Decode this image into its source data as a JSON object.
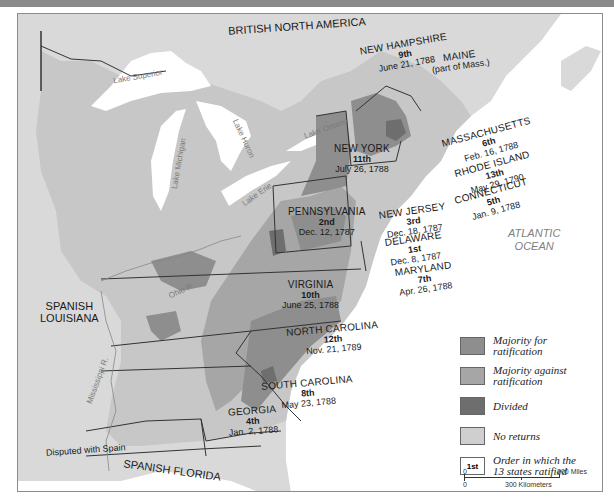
{
  "colors": {
    "majority_for": "#8e8e8e",
    "majority_against": "#a6a6a6",
    "divided": "#6e6e6e",
    "no_returns": "#cfcfcf",
    "foreign": "#d9d9d9",
    "water": "#ffffff",
    "border": "#333333"
  },
  "regions": {
    "british_north_america": "BRITISH NORTH AMERICA",
    "spanish_louisiana": "SPANISH\nLOUISIANA",
    "spanish_louisiana_l1": "SPANISH",
    "spanish_louisiana_l2": "LOUISIANA",
    "spanish_florida": "SPANISH FLORIDA",
    "disputed": "Disputed with Spain",
    "ocean_l1": "ATLANTIC",
    "ocean_l2": "OCEAN"
  },
  "water_labels": {
    "lake_superior": "Lake Superior",
    "lake_michigan": "Lake Michigan",
    "lake_huron": "Lake Huron",
    "lake_ontario": "Lake Ontario",
    "lake_erie": "Lake Erie",
    "ohio_river": "Ohio R.",
    "mississippi_river": "Mississippi R."
  },
  "states": [
    {
      "name": "NEW HAMPSHIRE",
      "order": "9th",
      "date": "June 21, 1788"
    },
    {
      "name": "MAINE",
      "order": "",
      "date": "(part of Mass.)"
    },
    {
      "name": "MASSACHUSETTS",
      "order": "6th",
      "date": "Feb. 16, 1788"
    },
    {
      "name": "NEW YORK",
      "order": "11th",
      "date": "July 26, 1788"
    },
    {
      "name": "RHODE ISLAND",
      "order": "13th",
      "date": "May 29, 1790"
    },
    {
      "name": "CONNECTICUT",
      "order": "5th",
      "date": "Jan. 9, 1788"
    },
    {
      "name": "PENNSYLVANIA",
      "order": "2nd",
      "date": "Dec. 12, 1787"
    },
    {
      "name": "NEW JERSEY",
      "order": "3rd",
      "date": "Dec. 18, 1787"
    },
    {
      "name": "DELAWARE",
      "order": "1st",
      "date": "Dec. 8, 1787"
    },
    {
      "name": "MARYLAND",
      "order": "7th",
      "date": "Apr. 26, 1788"
    },
    {
      "name": "VIRGINIA",
      "order": "10th",
      "date": "June 25, 1788"
    },
    {
      "name": "NORTH CAROLINA",
      "order": "12th",
      "date": "Nov. 21, 1789"
    },
    {
      "name": "SOUTH CAROLINA",
      "order": "8th",
      "date": "May 23, 1788"
    },
    {
      "name": "GEORGIA",
      "order": "4th",
      "date": "Jan. 2, 1788"
    }
  ],
  "legend": {
    "items": [
      {
        "label_l1": "Majority for",
        "label_l2": "ratification",
        "swatch": "majority_for"
      },
      {
        "label_l1": "Majority against",
        "label_l2": "ratification",
        "swatch": "majority_against"
      },
      {
        "label_l1": "Divided",
        "label_l2": "",
        "swatch": "divided"
      },
      {
        "label_l1": "No returns",
        "label_l2": "",
        "swatch": "no_returns"
      }
    ],
    "order_box": "1st",
    "order_l1": "Order in which the",
    "order_l2": "13 states ratified"
  },
  "scale": {
    "zero_top": "0",
    "miles": "300 Miles",
    "zero_bottom": "0",
    "km": "300 Kilometers"
  }
}
